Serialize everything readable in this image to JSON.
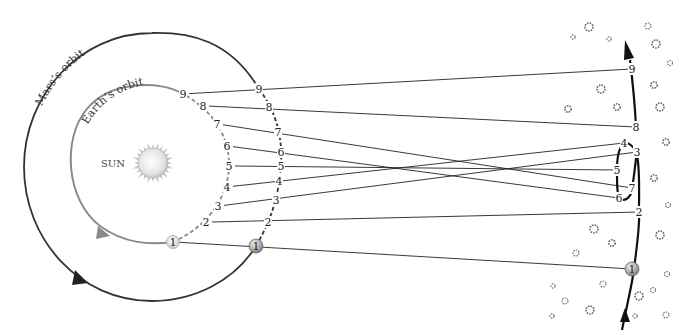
{
  "diagram": {
    "sun": {
      "label": "SUN",
      "cx": 153,
      "cy": 163,
      "r": 17,
      "color": "#d8d8d8"
    },
    "earth_orbit": {
      "label": "Earth’s orbit",
      "cx": 150,
      "cy": 162,
      "r": 78,
      "color": "#8a8a8a",
      "positions": [
        {
          "n": "1",
          "x": 173,
          "y": 242
        },
        {
          "n": "2",
          "x": 206,
          "y": 222
        },
        {
          "n": "3",
          "x": 218,
          "y": 206
        },
        {
          "n": "4",
          "x": 227,
          "y": 187
        },
        {
          "n": "5",
          "x": 229,
          "y": 166
        },
        {
          "n": "6",
          "x": 227,
          "y": 146
        },
        {
          "n": "7",
          "x": 217,
          "y": 124
        },
        {
          "n": "8",
          "x": 203,
          "y": 106
        },
        {
          "n": "9",
          "x": 183,
          "y": 94
        }
      ]
    },
    "mars_orbit": {
      "label": "Mars’s orbit",
      "cx": 152,
      "cy": 167,
      "rx": 128,
      "ry": 134,
      "color": "#333333",
      "positions": [
        {
          "n": "1",
          "x": 256,
          "y": 246
        },
        {
          "n": "2",
          "x": 268,
          "y": 222
        },
        {
          "n": "3",
          "x": 276,
          "y": 200
        },
        {
          "n": "4",
          "x": 279,
          "y": 181
        },
        {
          "n": "5",
          "x": 281,
          "y": 166
        },
        {
          "n": "6",
          "x": 281,
          "y": 152
        },
        {
          "n": "7",
          "x": 278,
          "y": 132
        },
        {
          "n": "8",
          "x": 269,
          "y": 107
        },
        {
          "n": "9",
          "x": 259,
          "y": 89
        }
      ]
    },
    "apparent_path": {
      "color": "#111111",
      "positions": [
        {
          "n": "1",
          "x": 632,
          "y": 269
        },
        {
          "n": "2",
          "x": 639,
          "y": 212
        },
        {
          "n": "3",
          "x": 637,
          "y": 152
        },
        {
          "n": "4",
          "x": 624,
          "y": 143
        },
        {
          "n": "5",
          "x": 617,
          "y": 170
        },
        {
          "n": "6",
          "x": 619,
          "y": 198
        },
        {
          "n": "7",
          "x": 632,
          "y": 188
        },
        {
          "n": "8",
          "x": 636,
          "y": 127
        },
        {
          "n": "9",
          "x": 632,
          "y": 69
        }
      ]
    },
    "stars": [
      [
        589,
        27,
        4
      ],
      [
        573,
        37,
        2.2
      ],
      [
        609,
        39,
        2.2
      ],
      [
        648,
        26,
        3
      ],
      [
        656,
        44,
        4
      ],
      [
        670,
        63,
        2.5
      ],
      [
        601,
        89,
        4
      ],
      [
        568,
        109,
        3.2
      ],
      [
        617,
        107,
        3.2
      ],
      [
        654,
        85,
        3.2
      ],
      [
        660,
        107,
        4
      ],
      [
        666,
        142,
        3.2
      ],
      [
        654,
        178,
        3.2
      ],
      [
        668,
        205,
        2.5
      ],
      [
        594,
        229,
        4
      ],
      [
        612,
        243,
        3.2
      ],
      [
        576,
        253,
        3
      ],
      [
        660,
        235,
        4
      ],
      [
        667,
        274,
        2.5
      ],
      [
        553,
        286,
        2.2
      ],
      [
        565,
        301,
        3
      ],
      [
        603,
        284,
        3
      ],
      [
        639,
        296,
        4
      ],
      [
        653,
        290,
        2.5
      ],
      [
        590,
        310,
        4
      ],
      [
        552,
        316,
        2.2
      ],
      [
        635,
        316,
        2.2
      ],
      [
        666,
        315,
        3
      ]
    ]
  }
}
